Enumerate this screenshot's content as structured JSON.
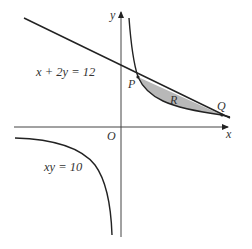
{
  "diagram": {
    "type": "coordinate-graph",
    "axes": {
      "x_label": "x",
      "y_label": "y",
      "origin_label": "O"
    },
    "curves": [
      {
        "id": "line",
        "equation": "x + 2y = 12",
        "label": "x + 2y = 12"
      },
      {
        "id": "hyperbola",
        "equation": "xy = 10",
        "label": "xy = 10"
      }
    ],
    "points": [
      {
        "label": "P",
        "coords": [
          2,
          5
        ]
      },
      {
        "label": "Q",
        "coords": [
          10,
          1
        ]
      }
    ],
    "region": {
      "label": "R",
      "fill": "#b8b8b8",
      "description": "Shaded region between line and hyperbola from P to Q"
    },
    "colors": {
      "stroke": "#222222",
      "text": "#333333",
      "shade": "#b8b8b8"
    }
  }
}
